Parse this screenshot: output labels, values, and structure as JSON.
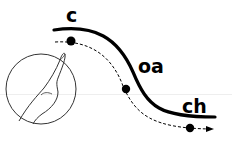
{
  "diagram": {
    "labels": {
      "start": "c",
      "middle": "oa",
      "end": "ch"
    },
    "icons": {
      "hand": "pointing-finger-icon",
      "arrow": "arrow-right-icon"
    },
    "colors": {
      "stroke": "#000000",
      "background": "#ffffff",
      "guide_line": "#eeeeee"
    }
  }
}
